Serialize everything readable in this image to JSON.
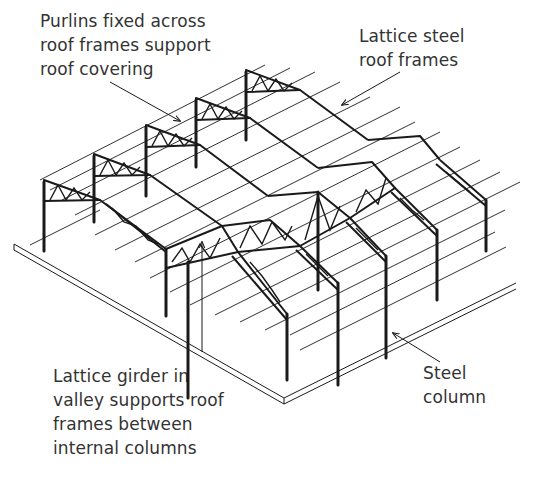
{
  "diagram": {
    "labels": [
      {
        "id": "purlins",
        "lines": [
          "Purlins fixed across",
          "roof frames support",
          "roof covering"
        ]
      },
      {
        "id": "lattice_frames",
        "lines": [
          "Lattice steel",
          "roof frames"
        ]
      },
      {
        "id": "girder",
        "lines": [
          "Lattice girder in",
          "valley supports roof",
          "frames between",
          "internal columns"
        ]
      },
      {
        "id": "column",
        "lines": [
          "Steel",
          "column"
        ]
      }
    ],
    "components": [
      "purlins",
      "lattice steel roof frames",
      "lattice valley girder",
      "steel columns",
      "ground slab"
    ],
    "colors": {
      "line": "#1a1a1a",
      "text": "#333333",
      "background": "#ffffff"
    }
  }
}
